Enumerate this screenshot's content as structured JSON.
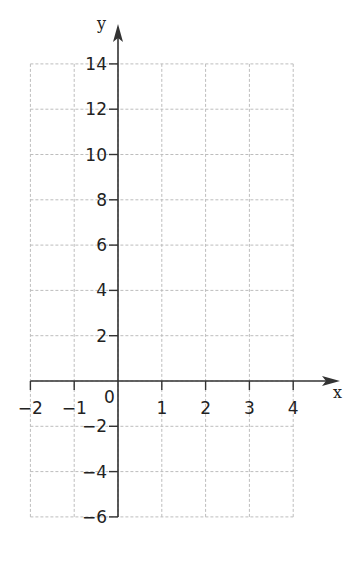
{
  "chart_data": {
    "type": "line",
    "title": "",
    "xlabel": "x",
    "ylabel": "y",
    "xlim": [
      -2,
      4
    ],
    "ylim": [
      -6,
      14
    ],
    "x_ticks": [
      -2,
      -1,
      0,
      1,
      2,
      3,
      4
    ],
    "x_tick_labels": [
      "−2",
      "−1",
      "0",
      "1",
      "2",
      "3",
      "4"
    ],
    "y_ticks": [
      -6,
      -4,
      -2,
      2,
      4,
      6,
      8,
      10,
      12,
      14
    ],
    "y_tick_labels": [
      "−6",
      "−4",
      "−2",
      "2",
      "4",
      "6",
      "8",
      "10",
      "12",
      "14"
    ],
    "origin_label": "0",
    "grid": true,
    "grid_style": "dashed",
    "series": [],
    "legend": null
  },
  "colors": {
    "axis": "#333333",
    "grid": "#bdbdbd",
    "text": "#222222",
    "background": "#ffffff"
  }
}
